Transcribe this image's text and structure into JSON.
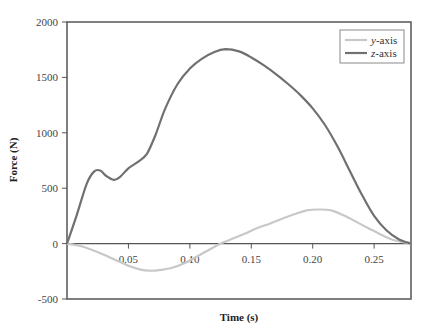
{
  "chart_data": {
    "type": "line",
    "title": "",
    "xlabel": "Time (s)",
    "ylabel": "Force (N)",
    "xlim": [
      0,
      0.28
    ],
    "ylim": [
      -500,
      2000
    ],
    "grid": false,
    "legend_position": "upper right",
    "x_ticks": [
      "0.05",
      "0.10",
      "0.15",
      "0.20",
      "0.25"
    ],
    "y_ticks": [
      "-500",
      "0",
      "500",
      "1000",
      "1500",
      "2000"
    ],
    "series": [
      {
        "name": "y-axis",
        "color": "#c8c8c8",
        "x": [
          0,
          0.01,
          0.02,
          0.03,
          0.04,
          0.05,
          0.06,
          0.067,
          0.075,
          0.085,
          0.095,
          0.105,
          0.115,
          0.125,
          0.135,
          0.145,
          0.155,
          0.165,
          0.175,
          0.185,
          0.195,
          0.205,
          0.215,
          0.225,
          0.235,
          0.245,
          0.255,
          0.265,
          0.28
        ],
        "values": [
          0,
          -20,
          -55,
          -100,
          -150,
          -200,
          -235,
          -245,
          -240,
          -220,
          -180,
          -120,
          -60,
          0,
          45,
          90,
          140,
          180,
          225,
          265,
          300,
          308,
          300,
          255,
          200,
          140,
          85,
          35,
          0
        ]
      },
      {
        "name": "z-axis",
        "color": "#707070",
        "x": [
          0,
          0.008,
          0.016,
          0.022,
          0.027,
          0.032,
          0.038,
          0.043,
          0.05,
          0.058,
          0.065,
          0.072,
          0.08,
          0.09,
          0.1,
          0.11,
          0.12,
          0.129,
          0.14,
          0.15,
          0.16,
          0.17,
          0.18,
          0.19,
          0.2,
          0.21,
          0.22,
          0.23,
          0.24,
          0.25,
          0.26,
          0.27,
          0.28
        ],
        "values": [
          0,
          260,
          540,
          650,
          660,
          610,
          575,
          600,
          680,
          740,
          810,
          980,
          1220,
          1440,
          1580,
          1670,
          1730,
          1755,
          1735,
          1680,
          1610,
          1530,
          1440,
          1340,
          1220,
          1070,
          880,
          660,
          440,
          250,
          120,
          40,
          0
        ]
      }
    ]
  },
  "legend": {
    "items": [
      {
        "label": "y-axis",
        "italic_prefix": "y",
        "suffix": "-axis"
      },
      {
        "label": "z-axis",
        "italic_prefix": "z",
        "suffix": "-axis"
      }
    ]
  }
}
